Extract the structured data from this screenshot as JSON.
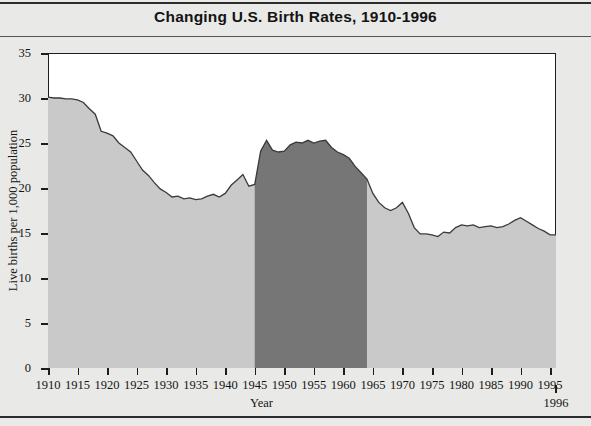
{
  "figure": {
    "title": "Changing U.S. Birth Rates, 1910-1996",
    "end_year_label": "1996"
  },
  "colors": {
    "page_background": "#e9e9e7",
    "plot_background": "#ffffff",
    "area_fill": "#c9c9c9",
    "highlight_fill": "#767676",
    "line": "#3a3a3a",
    "axis": "#1d1d1d",
    "text": "#141414"
  },
  "chart_data": {
    "type": "area",
    "title": "Changing U.S. Birth Rates, 1910-1996",
    "xlabel": "Year",
    "ylabel": "Live births per 1,000 population",
    "xlim": [
      1910,
      1996
    ],
    "ylim": [
      0,
      35
    ],
    "ytick_values": [
      0,
      5,
      10,
      15,
      20,
      25,
      30,
      35
    ],
    "ytick_labels": [
      "0",
      "5",
      "10",
      "15",
      "20",
      "25",
      "30",
      "35"
    ],
    "xtick_values": [
      1910,
      1915,
      1920,
      1925,
      1930,
      1935,
      1940,
      1945,
      1950,
      1955,
      1960,
      1965,
      1970,
      1975,
      1980,
      1985,
      1990,
      1995
    ],
    "xtick_labels": [
      "1910",
      "1915",
      "1920",
      "1925",
      "1930",
      "1935",
      "1940",
      "1945",
      "1950",
      "1955",
      "1960",
      "1965",
      "1970",
      "1975",
      "1980",
      "1985",
      "1990",
      "1995"
    ],
    "grid": false,
    "legend": null,
    "highlight_region": {
      "name": "baby-boom",
      "x_start": 1945,
      "x_end": 1964,
      "fill": "#767676"
    },
    "series": [
      {
        "name": "Live births per 1,000 population",
        "x": [
          1910,
          1911,
          1912,
          1913,
          1914,
          1915,
          1916,
          1917,
          1918,
          1919,
          1920,
          1921,
          1922,
          1923,
          1924,
          1925,
          1926,
          1927,
          1928,
          1929,
          1930,
          1931,
          1932,
          1933,
          1934,
          1935,
          1936,
          1937,
          1938,
          1939,
          1940,
          1941,
          1942,
          1943,
          1944,
          1945,
          1946,
          1947,
          1948,
          1949,
          1950,
          1951,
          1952,
          1953,
          1954,
          1955,
          1956,
          1957,
          1958,
          1959,
          1960,
          1961,
          1962,
          1963,
          1964,
          1965,
          1966,
          1967,
          1968,
          1969,
          1970,
          1971,
          1972,
          1973,
          1974,
          1975,
          1976,
          1977,
          1978,
          1979,
          1980,
          1981,
          1982,
          1983,
          1984,
          1985,
          1986,
          1987,
          1988,
          1989,
          1990,
          1991,
          1992,
          1993,
          1994,
          1995,
          1996
        ],
        "y": [
          30.1,
          30.0,
          30.0,
          29.9,
          29.9,
          29.8,
          29.5,
          28.8,
          28.2,
          26.3,
          26.1,
          25.8,
          25.0,
          24.5,
          24.0,
          23.0,
          22.0,
          21.4,
          20.6,
          19.9,
          19.5,
          19.0,
          19.1,
          18.8,
          18.9,
          18.7,
          18.8,
          19.1,
          19.3,
          19.0,
          19.4,
          20.3,
          20.9,
          21.5,
          20.2,
          20.4,
          24.1,
          25.3,
          24.2,
          24.0,
          24.1,
          24.8,
          25.1,
          25.0,
          25.3,
          25.0,
          25.2,
          25.3,
          24.5,
          24.0,
          23.7,
          23.3,
          22.4,
          21.7,
          21.0,
          19.4,
          18.4,
          17.8,
          17.5,
          17.8,
          18.4,
          17.2,
          15.6,
          14.9,
          14.9,
          14.8,
          14.6,
          15.1,
          15.0,
          15.6,
          15.9,
          15.8,
          15.9,
          15.6,
          15.7,
          15.8,
          15.6,
          15.7,
          16.0,
          16.4,
          16.7,
          16.3,
          15.9,
          15.5,
          15.2,
          14.8,
          14.8
        ]
      }
    ]
  },
  "axes": {
    "ylabel_text": "Live births per 1,000 population",
    "xlabel_text": "Year"
  }
}
